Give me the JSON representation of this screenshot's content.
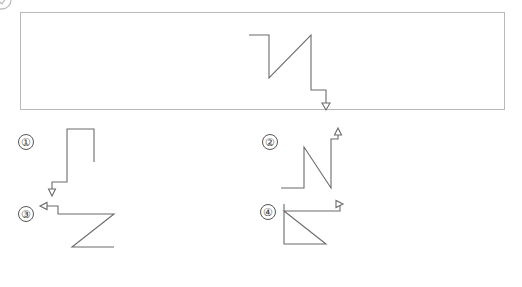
{
  "page": {
    "kind": "spatial-reasoning-question",
    "background_color": "#ffffff",
    "stroke_color": "#6b6b6b",
    "frame_color": "#b9b9b9",
    "text_color": "#3a3a3a",
    "width": 522,
    "height": 287
  },
  "corner_mark": {
    "description": "partially cropped circled glyph at top-left edge",
    "visible": true
  },
  "stimulus": {
    "frame": {
      "x": 20,
      "y": 12,
      "width": 485,
      "height": 98
    },
    "figure": {
      "points": "228,22 248,22 248,65 290,22 290,77 305,77 305,93",
      "arrow": {
        "type": "arrowhead-down",
        "x": 305,
        "y": 96
      }
    }
  },
  "options": [
    {
      "id": "option-1",
      "label": "①",
      "label_plain": "1",
      "label_pos": {
        "x": 4,
        "y": 8
      },
      "figure": {
        "points": "80,36 80,3 53,3 53,56 38,56 38,66",
        "arrow": {
          "type": "arrowhead-down",
          "x": 38,
          "y": 69
        }
      }
    },
    {
      "id": "option-2",
      "label": "②",
      "label_plain": "2",
      "label_pos": {
        "x": 4,
        "y": 8
      },
      "figure": {
        "points": "23,62 46,62 46,21 73,62 73,13 80,13 80,5",
        "arrow": {
          "type": "arrowhead-up",
          "x": 80,
          "y": 2
        }
      }
    },
    {
      "id": "option-3",
      "label": "③",
      "label_plain": "3",
      "label_pos": {
        "x": 4,
        "y": 6
      },
      "figure": {
        "points": "100,47 58,47 100,14 44,14 44,6 29,6",
        "arrow": {
          "type": "arrowhead-left",
          "x": 26,
          "y": 6
        }
      }
    },
    {
      "id": "option-4",
      "label": "④",
      "label_plain": "4",
      "label_pos": {
        "x": 2,
        "y": 4
      },
      "figure": {
        "points": "26,4 26,44 68,44 26,11 82,11 82,4",
        "arrow": {
          "type": "arrowhead-right",
          "x": 85,
          "y": 4
        }
      }
    }
  ]
}
